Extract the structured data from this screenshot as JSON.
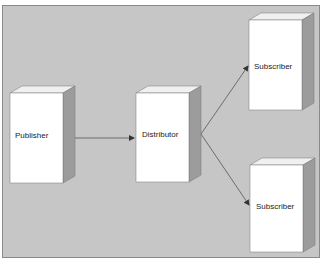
{
  "diagram": {
    "type": "publish-subscribe replication topology",
    "background_color": "#c6c6c6",
    "box_front_color": "#ffffff",
    "box_side_color": "#9c9c9c",
    "box_top_color": "#f0f0f0",
    "edge_color": "#555555",
    "nodes": [
      {
        "id": "publisher",
        "label": "Publisher"
      },
      {
        "id": "distributor",
        "label": "Distributor"
      },
      {
        "id": "subscriber1",
        "label": "Subscriber"
      },
      {
        "id": "subscriber2",
        "label": "Subscriber"
      }
    ],
    "edges": [
      {
        "from": "publisher",
        "to": "distributor"
      },
      {
        "from": "distributor",
        "to": "subscriber1"
      },
      {
        "from": "distributor",
        "to": "subscriber2"
      }
    ]
  }
}
